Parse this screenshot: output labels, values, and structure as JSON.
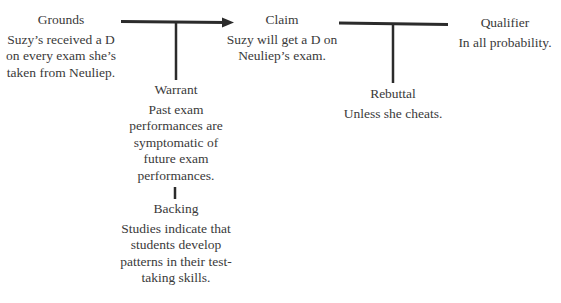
{
  "diagram": {
    "type": "toulmin-model",
    "colors": {
      "text": "#3a3a3a",
      "line": "#2b2b2b",
      "background": "#ffffff"
    },
    "nodes": {
      "grounds": {
        "title": "Grounds",
        "lines": [
          "Suzy’s received a D",
          "on every exam she’s",
          "taken from Neuliep."
        ]
      },
      "claim": {
        "title": "Claim",
        "lines": [
          "Suzy will get a D on",
          "Neuliep’s exam."
        ]
      },
      "qualifier": {
        "title": "Qualifier",
        "lines": [
          "In all probability."
        ]
      },
      "warrant": {
        "title": "Warrant",
        "lines": [
          "Past exam",
          "performances are",
          "symptomatic of",
          "future exam",
          "performances."
        ]
      },
      "rebuttal": {
        "title": "Rebuttal",
        "lines": [
          "Unless she cheats."
        ]
      },
      "backing": {
        "title": "Backing",
        "lines": [
          "Studies indicate that",
          "students develop",
          "patterns in their test-",
          "taking skills."
        ]
      }
    },
    "connectors": [
      {
        "from": "grounds",
        "to": "claim",
        "style": "arrow"
      },
      {
        "from": "grounds-claim-arrow",
        "to": "warrant",
        "style": "line"
      },
      {
        "from": "claim",
        "to": "qualifier",
        "style": "line"
      },
      {
        "from": "claim-qualifier-line",
        "to": "rebuttal",
        "style": "line"
      },
      {
        "from": "warrant",
        "to": "backing",
        "style": "line"
      }
    ]
  }
}
